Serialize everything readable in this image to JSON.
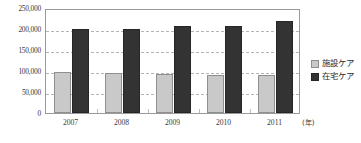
{
  "chart_data": {
    "type": "bar",
    "title": "",
    "xlabel": "(年)",
    "ylabel": "",
    "categories": [
      "2007",
      "2008",
      "2009",
      "2010",
      "2011"
    ],
    "series": [
      {
        "name": "施設ケア",
        "color": "#c9c9c9",
        "values": [
          97000,
          95000,
          94000,
          91000,
          90000
        ]
      },
      {
        "name": "在宅ケア",
        "color": "#333333",
        "values": [
          200000,
          200000,
          207000,
          207000,
          218000
        ]
      }
    ],
    "ylim": [
      0,
      250000
    ],
    "yticks": [
      0,
      50000,
      100000,
      150000,
      200000,
      250000
    ],
    "ytick_labels": [
      "0",
      "50,000",
      "100,000",
      "150,000",
      "200,000",
      "250,000"
    ],
    "grid": true,
    "grid_axis": "y",
    "legend_position": "right"
  },
  "axes": {
    "x_unit_label": "(年)"
  },
  "legend": {
    "items": [
      {
        "label": "施設ケア",
        "swatch": "light-gray-square"
      },
      {
        "label": "在宅ケア",
        "swatch": "dark-square"
      }
    ]
  }
}
